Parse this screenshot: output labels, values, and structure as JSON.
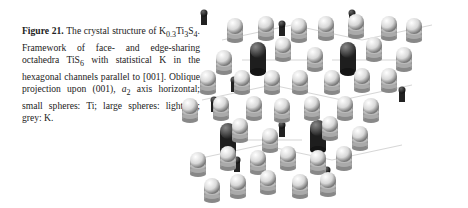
{
  "figure": {
    "label": "Figure 21.",
    "caption_parts": {
      "p1": " The crystal structure of K",
      "sub1": "0.3",
      "p2": "Ti",
      "sub2": "3",
      "p3": "S",
      "sub3": "4",
      "p4": ". Framework of face- and edge-sharing octahedra TiS",
      "sub4": "6",
      "p5": " with statistical K in the hexagonal channels parallel to [001]. Oblique projection upon (001), ",
      "ital": "a",
      "sub5": "2",
      "p6": " axis horizontal; small spheres: Ti; large spheres: light: S; grey: K."
    },
    "image_description": "Ball-and-stick crystal structure, hexagonal channels with grey K spheres, light S spheres, small dark Ti spheres",
    "colors": {
      "sulfur": "#e6e6e6",
      "titanium": "#333333",
      "potassium": "#555555"
    }
  }
}
